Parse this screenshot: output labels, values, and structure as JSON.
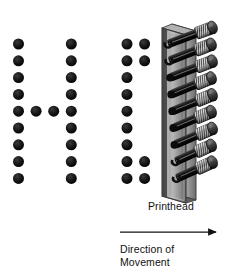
{
  "figure": {
    "background_color": "#ffffff",
    "dot_color": "#111111",
    "width": 245,
    "height": 275
  },
  "labels": {
    "printhead": "Printhead",
    "direction_line1": "Direction of",
    "direction_line2": "Movement",
    "direction_full": "Direction of Movement"
  },
  "arrow": {
    "name": "direction-of-movement-arrow",
    "points_to": "right",
    "color": "#111111",
    "x1": 120,
    "x2": 222,
    "y": 232
  },
  "matrix": {
    "rows": 9,
    "dot_diameter": 11,
    "row_spacing": 16.8,
    "col_spacing": 17.6,
    "first_row_center_y": 44,
    "characters": [
      {
        "glyph": "H",
        "name": "printed-character-h",
        "columns": 4,
        "first_col_center_x": 18.5,
        "pattern": [
          [
            1,
            0,
            0,
            1
          ],
          [
            1,
            0,
            0,
            1
          ],
          [
            1,
            0,
            0,
            1
          ],
          [
            1,
            0,
            0,
            1
          ],
          [
            1,
            1,
            1,
            1
          ],
          [
            1,
            0,
            0,
            1
          ],
          [
            1,
            0,
            0,
            1
          ],
          [
            1,
            0,
            0,
            1
          ],
          [
            1,
            0,
            0,
            1
          ]
        ]
      },
      {
        "glyph": "I",
        "name": "printed-character-i",
        "columns": 2,
        "first_col_center_x": 127,
        "pattern": [
          [
            1,
            1
          ],
          [
            1,
            1
          ],
          [
            1,
            0
          ],
          [
            1,
            0
          ],
          [
            1,
            0
          ],
          [
            1,
            0
          ],
          [
            1,
            0
          ],
          [
            1,
            1
          ],
          [
            1,
            1
          ]
        ]
      }
    ]
  },
  "printhead": {
    "name": "printhead-assembly",
    "pin_count": 9,
    "body_color": "#8d8d8d",
    "body_edge_color": "#4a4a4a",
    "body_highlight_color": "#c9c9c9",
    "pin_shaft_color": "#1d1d1d",
    "coil_color": "#3a3a3a",
    "coil_hatch_color": "#d8d8d8",
    "faceplate": {
      "x": 162,
      "y_top": 28,
      "y_bottom": 196,
      "width": 22
    },
    "pins": [
      {
        "index": 1,
        "state": "firing",
        "hole": "open"
      },
      {
        "index": 2,
        "state": "firing",
        "hole": "open"
      },
      {
        "index": 3,
        "state": "retracted",
        "hole": "closed"
      },
      {
        "index": 4,
        "state": "retracted",
        "hole": "closed"
      },
      {
        "index": 5,
        "state": "retracted",
        "hole": "closed"
      },
      {
        "index": 6,
        "state": "retracted",
        "hole": "closed"
      },
      {
        "index": 7,
        "state": "retracted",
        "hole": "closed"
      },
      {
        "index": 8,
        "state": "firing",
        "hole": "open"
      },
      {
        "index": 9,
        "state": "firing",
        "hole": "open"
      }
    ]
  }
}
